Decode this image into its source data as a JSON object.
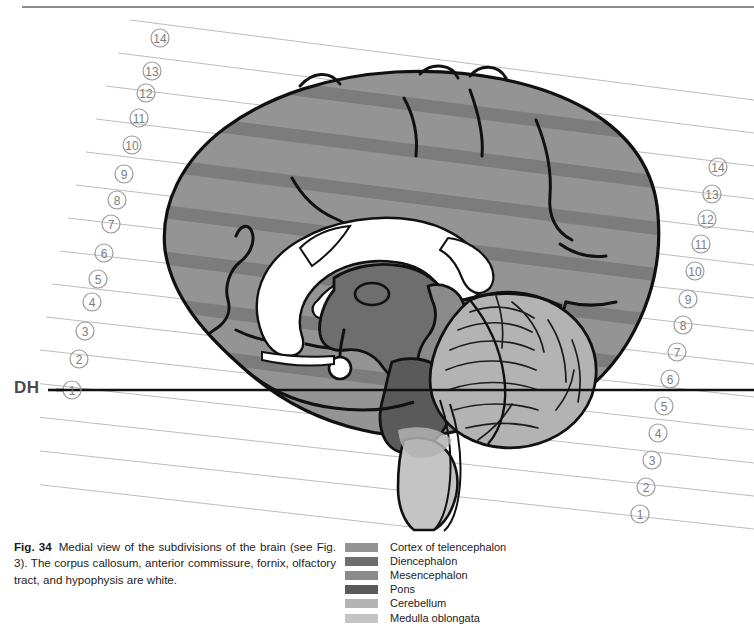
{
  "figure": {
    "id": "fig-34",
    "number_label": "Fig. 34",
    "caption_text": "Medial view of the subdivisions of the brain (see Fig. 3). The corpus callosum, anterior commissure, fornix, olfactory tract, and hypophysis are white.",
    "reference_line_label": "DH",
    "reference_line_color": "#111111"
  },
  "scale_left": {
    "name": "left-reference-scale",
    "marks": [
      "⑭",
      "⑬",
      "⑫",
      "⑪",
      "⑩",
      "⑨",
      "⑧",
      "⑦",
      "⑥",
      "⑤",
      "④",
      "③",
      "②",
      "①"
    ],
    "values": [
      14,
      13,
      12,
      11,
      10,
      9,
      8,
      7,
      6,
      5,
      4,
      3,
      2,
      1
    ]
  },
  "scale_right": {
    "name": "right-reference-scale",
    "marks": [
      "⑭",
      "⑬",
      "⑫",
      "⑪",
      "⑩",
      "⑨",
      "⑧",
      "⑦",
      "⑥",
      "⑤",
      "④",
      "③",
      "②",
      "①"
    ],
    "values": [
      14,
      13,
      12,
      11,
      10,
      9,
      8,
      7,
      6,
      5,
      4,
      3,
      2,
      1
    ]
  },
  "legend": {
    "title": "Subdivisions of the brain",
    "items": [
      {
        "label": "Cortex of telencephalon",
        "color": "#949494"
      },
      {
        "label": "Diencephalon",
        "color": "#6e6e6e"
      },
      {
        "label": "Mesencephalon",
        "color": "#8a8a8a"
      },
      {
        "label": "Pons",
        "color": "#5a5a5a"
      },
      {
        "label": "Cerebellum",
        "color": "#b3b3b3"
      },
      {
        "label": "Medulla oblongata",
        "color": "#c4c4c4"
      }
    ]
  },
  "white_structures": {
    "label": "white (unshaded) structures",
    "items": [
      "corpus callosum",
      "anterior commissure",
      "fornix",
      "olfactory tract",
      "hypophysis"
    ],
    "color": "#ffffff"
  },
  "artwork": {
    "outline_color": "#111111",
    "grid_line_color": "#b9b9b9",
    "background": "#ffffff"
  }
}
